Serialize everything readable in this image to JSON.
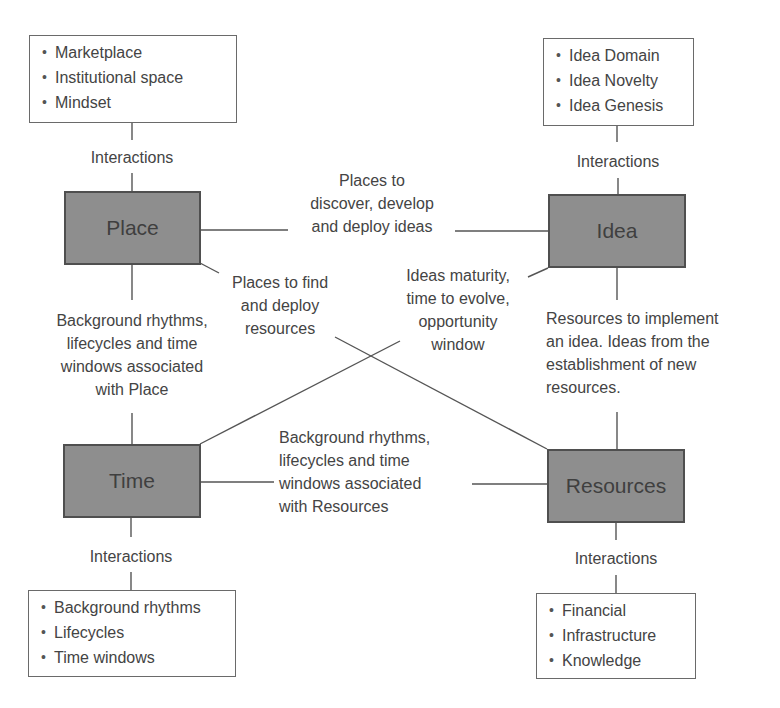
{
  "diagram": {
    "nodes": {
      "place": {
        "label": "Place",
        "fill": "#8e8e8e"
      },
      "idea": {
        "label": "Idea",
        "fill": "#8e8e8e"
      },
      "time": {
        "label": "Time",
        "fill": "#8e8e8e"
      },
      "resources": {
        "label": "Resources",
        "fill": "#8e8e8e"
      }
    },
    "lists": {
      "place": [
        "Marketplace",
        "Institutional space",
        "Mindset"
      ],
      "idea": [
        "Idea Domain",
        "Idea Novelty",
        "Idea Genesis"
      ],
      "time": [
        "Background rhythms",
        "Lifecycles",
        "Time windows"
      ],
      "resources": [
        "Financial",
        "Infrastructure",
        "Knowledge"
      ]
    },
    "interactions_labels": {
      "place": "Interactions",
      "idea": "Interactions",
      "time": "Interactions",
      "resources": "Interactions"
    },
    "edges": {
      "place_idea": [
        "Places to",
        "discover, develop",
        "and deploy ideas"
      ],
      "place_resources": [
        "Places to find",
        "and deploy",
        "resources"
      ],
      "idea_time": [
        "Ideas maturity,",
        "time to evolve,",
        "opportunity",
        "window"
      ],
      "place_time": [
        "Background rhythms,",
        "lifecycles and time",
        "windows associated",
        "with Place"
      ],
      "idea_resources": [
        "Resources to implement",
        "an idea. Ideas from the",
        "establishment of new",
        "resources."
      ],
      "time_resources": [
        "Background rhythms,",
        "lifecycles and time",
        "windows associated",
        "with Resources"
      ]
    }
  }
}
